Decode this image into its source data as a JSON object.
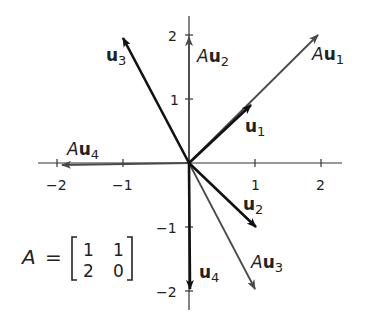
{
  "diagram": {
    "matrix": {
      "name": "A",
      "rows": [
        [
          "1",
          "1"
        ],
        [
          "2",
          "0"
        ]
      ],
      "equals": "="
    },
    "axes": {
      "x_ticks": [
        {
          "v": -2,
          "label": "−2"
        },
        {
          "v": -1,
          "label": "−1"
        },
        {
          "v": 1,
          "label": "1"
        },
        {
          "v": 2,
          "label": "2"
        }
      ],
      "y_ticks": [
        {
          "v": 2,
          "label": "2"
        },
        {
          "v": 1,
          "label": "1"
        },
        {
          "v": -1,
          "label": "−1"
        },
        {
          "v": -2,
          "label": "−2"
        }
      ]
    },
    "vectors": [
      {
        "id": "u1",
        "label_prefix": "",
        "label_bold": "u",
        "label_sub": "1",
        "x": 1,
        "y": 1,
        "kind": "input"
      },
      {
        "id": "u2",
        "label_prefix": "",
        "label_bold": "u",
        "label_sub": "2",
        "x": 1,
        "y": -1,
        "kind": "input"
      },
      {
        "id": "u3",
        "label_prefix": "",
        "label_bold": "u",
        "label_sub": "3",
        "x": -1,
        "y": 2,
        "kind": "input"
      },
      {
        "id": "u4",
        "label_prefix": "",
        "label_bold": "u",
        "label_sub": "4",
        "x": 0,
        "y": -2,
        "kind": "input"
      },
      {
        "id": "Au1",
        "label_prefix": "A",
        "label_bold": "u",
        "label_sub": "1",
        "x": 2,
        "y": 2,
        "kind": "image"
      },
      {
        "id": "Au2",
        "label_prefix": "A",
        "label_bold": "u",
        "label_sub": "2",
        "x": 0,
        "y": 2,
        "kind": "image"
      },
      {
        "id": "Au3",
        "label_prefix": "A",
        "label_bold": "u",
        "label_sub": "3",
        "x": 1,
        "y": -2,
        "kind": "image"
      },
      {
        "id": "Au4",
        "label_prefix": "A",
        "label_bold": "u",
        "label_sub": "4",
        "x": -2,
        "y": 0,
        "kind": "image"
      }
    ],
    "colors": {
      "input": "#111111",
      "image": "#4a4a4a",
      "axis": "#333333"
    }
  }
}
